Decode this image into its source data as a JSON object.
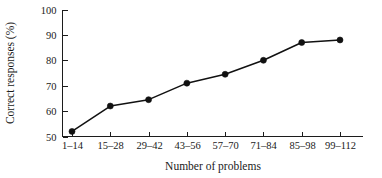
{
  "figure": {
    "background_color": "#ffffff",
    "ink_color": "#111111"
  },
  "chart_data": {
    "type": "line",
    "title": "",
    "subtitle": "",
    "xlabel": "Number of problems",
    "ylabel": "Correct responses (%)",
    "categories": [
      "1–14",
      "15–28",
      "29–42",
      "43–56",
      "57–70",
      "71–84",
      "85–98",
      "99–112"
    ],
    "values": [
      52,
      62,
      64.5,
      71,
      74.5,
      80,
      87,
      88
    ],
    "series": [
      {
        "name": "Correct responses",
        "values": [
          52,
          62,
          64.5,
          71,
          74.5,
          80,
          87,
          88
        ],
        "marker": "filled-circle",
        "color": "#111111"
      }
    ],
    "ylim": [
      50,
      100
    ],
    "yticks": [
      50,
      60,
      70,
      80,
      90,
      100
    ],
    "ytick_labels": [
      "50",
      "60",
      "70",
      "80",
      "90",
      "100"
    ],
    "xtick_labels": [
      "1–14",
      "15–28",
      "29–42",
      "43–56",
      "57–70",
      "71–84",
      "85–98",
      "99–112"
    ],
    "grid": false,
    "legend": "none",
    "annotations": []
  }
}
